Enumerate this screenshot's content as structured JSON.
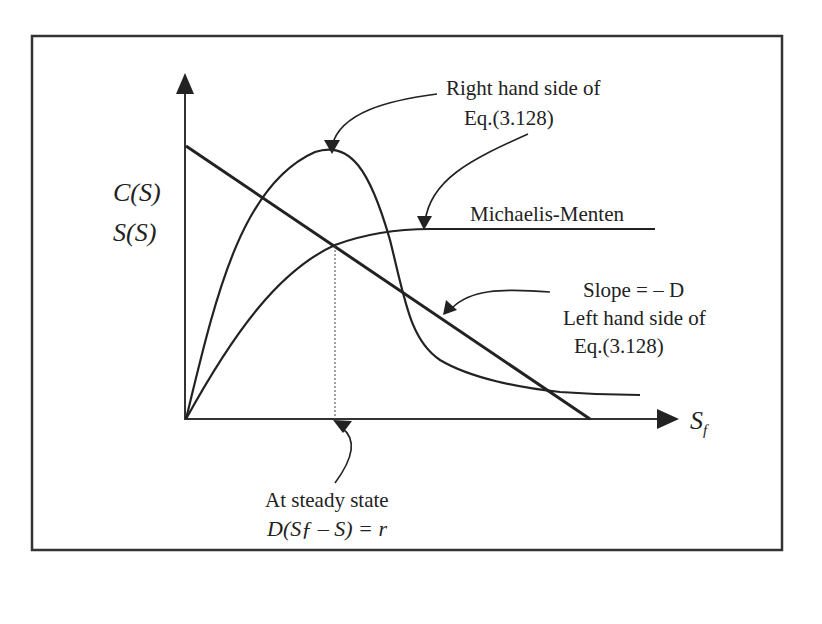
{
  "diagram": {
    "y_axis_label_line1": "C(S)",
    "y_axis_label_line2": "S(S)",
    "x_axis_label": "S",
    "x_axis_label_subscript": "f",
    "annotations": {
      "right_hand_side_line1": "Right hand side of",
      "right_hand_side_line2": "Eq.(3.128)",
      "michaelis_menten": "Michaelis-Menten",
      "slope": "Slope = – D",
      "left_hand_side_line1": "Left hand side of",
      "left_hand_side_line2": "Eq.(3.128)",
      "steady_state_line1": "At steady state",
      "steady_state_eq": "D(Sƒ – S) = r"
    },
    "curves": [
      {
        "name": "substrate-inhibition-curve",
        "description": "Right hand side of Eq.(3.128): rises from origin, peaks, then drops and levels off"
      },
      {
        "name": "michaelis-menten-curve",
        "description": "Rises from origin and saturates to a plateau"
      },
      {
        "name": "straight-line",
        "description": "Left hand side of Eq.(3.128): straight line with slope -D from y-intercept down to x-axis at S_f"
      }
    ],
    "colors": {
      "line": "#222222",
      "background": "#ffffff"
    }
  }
}
